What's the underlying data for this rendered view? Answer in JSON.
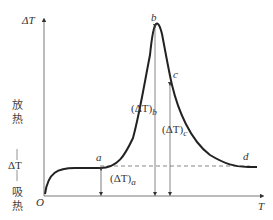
{
  "diagram": {
    "y_axis_label": "ΔT",
    "x_axis_label": "T",
    "origin_label": "O",
    "side_labels": {
      "exo_top": [
        "放",
        "热"
      ],
      "middle": "ΔT",
      "endo_bottom": [
        "吸",
        "热"
      ]
    },
    "points": {
      "a": "a",
      "b": "b",
      "c": "c",
      "d": "d"
    },
    "measures": {
      "a": "(ΔT)",
      "a_sub": "a",
      "b": "(ΔT)",
      "b_sub": "b",
      "c": "(ΔT)",
      "c_sub": "c"
    }
  }
}
